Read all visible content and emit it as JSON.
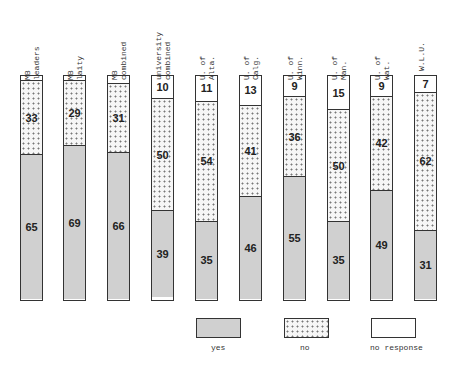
{
  "chart_data": {
    "type": "bar",
    "stacked": true,
    "orientation": "vertical",
    "title": "",
    "xlabel": "",
    "ylabel": "",
    "ylim": [
      0,
      100
    ],
    "unit": "percent",
    "categories": [
      "MB leaders",
      "MB laity",
      "MB combined",
      "university combined",
      "U. of Alta.",
      "U. of Calg.",
      "U. of Winn.",
      "U. of Man.",
      "U. of Wat.",
      "W.L.U."
    ],
    "series": [
      {
        "name": "yes",
        "values": [
          65,
          69,
          66,
          39,
          35,
          46,
          55,
          35,
          49,
          31
        ]
      },
      {
        "name": "no",
        "values": [
          33,
          29,
          31,
          50,
          54,
          41,
          36,
          50,
          42,
          62
        ]
      },
      {
        "name": "no response",
        "values": [
          2,
          2,
          3,
          10,
          11,
          13,
          9,
          15,
          9,
          7
        ]
      }
    ],
    "value_labels_shown": {
      "yes": [
        65,
        69,
        66,
        39,
        35,
        46,
        55,
        35,
        49,
        31
      ],
      "no": [
        33,
        29,
        31,
        50,
        54,
        41,
        36,
        50,
        42,
        62
      ],
      "no response": [
        null,
        null,
        null,
        10,
        11,
        13,
        9,
        15,
        9,
        7
      ]
    },
    "legend": [
      "yes",
      "no",
      "no response"
    ],
    "legend_position": "bottom-right",
    "grid": false
  },
  "labels": [
    {
      "line1": "MB",
      "line2": "leaders"
    },
    {
      "line1": "MB",
      "line2": "laity"
    },
    {
      "line1": "MB",
      "line2": "combined"
    },
    {
      "line1": "university",
      "line2": "combined"
    },
    {
      "line1": "U. of",
      "line2": "Alta."
    },
    {
      "line1": "U. of",
      "line2": "Calg."
    },
    {
      "line1": "U. of",
      "line2": "Winn."
    },
    {
      "line1": "U. of",
      "line2": "Man."
    },
    {
      "line1": "U. of",
      "line2": "Wat."
    },
    {
      "line1": "",
      "line2": "W.L.U."
    }
  ],
  "legend": {
    "yes": "yes",
    "no": "no",
    "no_response": "no response"
  }
}
